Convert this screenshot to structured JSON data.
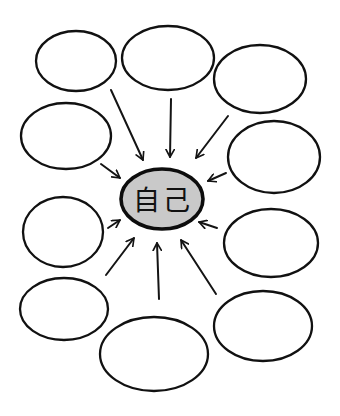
{
  "diagram": {
    "type": "radial-concept-map",
    "center": {
      "label": "自己",
      "cx": 162,
      "cy": 199,
      "rx": 41,
      "ry": 30,
      "fill": "#c9c9c9"
    },
    "outer_nodes": [
      {
        "id": "top-left",
        "label": "",
        "cx": 76,
        "cy": 61,
        "rx": 40,
        "ry": 30
      },
      {
        "id": "top-middle",
        "label": "",
        "cx": 168,
        "cy": 58,
        "rx": 46,
        "ry": 32
      },
      {
        "id": "top-right",
        "label": "",
        "cx": 260,
        "cy": 79,
        "rx": 46,
        "ry": 34
      },
      {
        "id": "left-upper",
        "label": "",
        "cx": 66,
        "cy": 136,
        "rx": 45,
        "ry": 33
      },
      {
        "id": "right-upper",
        "label": "",
        "cx": 274,
        "cy": 157,
        "rx": 46,
        "ry": 36
      },
      {
        "id": "left-middle",
        "label": "",
        "cx": 63,
        "cy": 232,
        "rx": 40,
        "ry": 35
      },
      {
        "id": "right-middle",
        "label": "",
        "cx": 271,
        "cy": 243,
        "rx": 47,
        "ry": 34
      },
      {
        "id": "left-lower",
        "label": "",
        "cx": 64,
        "cy": 309,
        "rx": 44,
        "ry": 31
      },
      {
        "id": "bottom-middle",
        "label": "",
        "cx": 154,
        "cy": 354,
        "rx": 54,
        "ry": 37
      },
      {
        "id": "bottom-right",
        "label": "",
        "cx": 263,
        "cy": 326,
        "rx": 49,
        "ry": 35
      }
    ],
    "arrows": [
      {
        "from": "top-left",
        "x1": 111,
        "y1": 90,
        "x2": 143,
        "y2": 160
      },
      {
        "from": "top-middle",
        "x1": 171,
        "y1": 99,
        "x2": 170,
        "y2": 157
      },
      {
        "from": "top-right",
        "x1": 228,
        "y1": 116,
        "x2": 196,
        "y2": 158
      },
      {
        "from": "left-upper",
        "x1": 101,
        "y1": 164,
        "x2": 120,
        "y2": 178
      },
      {
        "from": "right-upper",
        "x1": 226,
        "y1": 173,
        "x2": 208,
        "y2": 181
      },
      {
        "from": "left-middle",
        "x1": 108,
        "y1": 228,
        "x2": 120,
        "y2": 220
      },
      {
        "from": "right-middle",
        "x1": 217,
        "y1": 228,
        "x2": 199,
        "y2": 222
      },
      {
        "from": "left-lower",
        "x1": 106,
        "y1": 275,
        "x2": 134,
        "y2": 238
      },
      {
        "from": "bottom-middle",
        "x1": 159,
        "y1": 299,
        "x2": 157,
        "y2": 243
      },
      {
        "from": "bottom-right",
        "x1": 216,
        "y1": 294,
        "x2": 181,
        "y2": 240
      }
    ],
    "stroke_color": "#111111",
    "background": "#ffffff"
  }
}
